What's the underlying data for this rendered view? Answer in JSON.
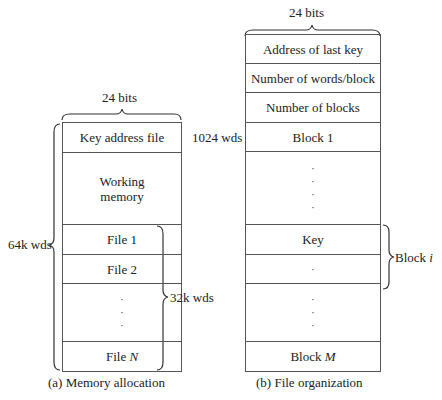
{
  "memory_allocation": {
    "width_label": "24 bits",
    "rows": [
      {
        "label": "Key address file",
        "side": "1024 wds"
      },
      {
        "label": "Working memory"
      },
      {
        "label": "File 1"
      },
      {
        "label": "File 2"
      },
      {
        "label": "· · ·"
      },
      {
        "label": "File",
        "italic": "N"
      }
    ],
    "total_label": "64k wds",
    "files_label": "32k wds",
    "caption": "(a)  Memory allocation"
  },
  "file_organization": {
    "width_label": "24 bits",
    "rows": [
      {
        "label": "Address of last key"
      },
      {
        "label": "Number of words/block"
      },
      {
        "label": "Number of blocks"
      },
      {
        "label": "Block 1"
      },
      {
        "label": "· · · ·"
      },
      {
        "label": "Key"
      },
      {
        "label": "·"
      },
      {
        "label": "· · ·"
      },
      {
        "label": "Block",
        "italic": "M"
      }
    ],
    "block_label": "Block",
    "block_italic": "i",
    "caption": "(b)  File organization"
  }
}
